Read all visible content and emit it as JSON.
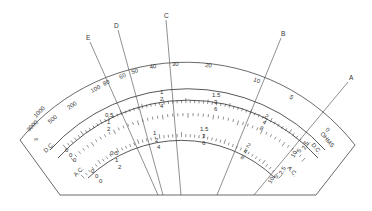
{
  "pointers": [
    {
      "label": "A"
    },
    {
      "label": "B"
    },
    {
      "label": "C"
    },
    {
      "label": "D"
    },
    {
      "label": "E"
    }
  ],
  "ohms_scale": {
    "unit_label": "OHMS",
    "ticks": [
      "∞",
      "3000",
      "1000",
      "500",
      "200",
      "100",
      "80",
      "60",
      "50",
      "40",
      "30",
      "20",
      "10",
      "5",
      "0"
    ]
  },
  "dc_scale": {
    "label": "D.C.",
    "row1": [
      "0",
      "0.5",
      "1",
      "1.5",
      "2",
      "2.5"
    ],
    "row2": [
      "0",
      "1",
      "2",
      "3",
      "4",
      "5"
    ],
    "row3": [
      "0",
      "2",
      "4",
      "6",
      "8",
      "10"
    ]
  },
  "ac_scale": {
    "label": "A.C.",
    "row1": [
      "0",
      "0.5",
      "1",
      "1.5",
      "2",
      "2.5"
    ],
    "row2": [
      "0",
      "1",
      "2",
      "3",
      "4",
      "5"
    ],
    "row3": [
      "0",
      "2",
      "4",
      "6",
      "8",
      "10"
    ]
  },
  "colors": {
    "line": "#444444",
    "background": "#ffffff"
  }
}
